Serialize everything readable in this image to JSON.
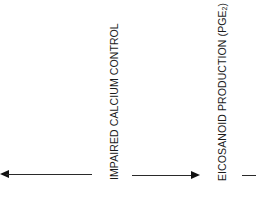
{
  "diagram": {
    "nodes": [
      {
        "id": "impaired-calcium-control",
        "label": "IMPAIRED CALCIUM CONTROL"
      },
      {
        "id": "eicosanoid-production",
        "label_main": "EICOSANOID PRODUCTION (PGE",
        "label_sub": "2",
        "label_end": ")"
      }
    ],
    "edges": [
      {
        "from": "impaired-calcium-control",
        "to": "left-offscreen",
        "direction": "left"
      },
      {
        "from": "impaired-calcium-control",
        "to": "eicosanoid-production",
        "direction": "right"
      },
      {
        "from": "eicosanoid-production",
        "to": "right-offscreen",
        "direction": "right"
      }
    ]
  }
}
